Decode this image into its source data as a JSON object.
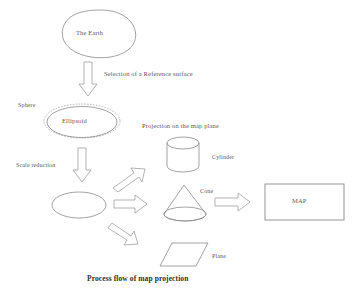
{
  "figure": {
    "caption": "Process flow of map projection",
    "background_color": "#ffffff",
    "stroke_color": "#8a8a8a",
    "text_color": "#5a5a5a"
  },
  "nodes": {
    "earth": {
      "label": "The Earth",
      "shape": "irregular-blob"
    },
    "sphere": {
      "label": "Sphere",
      "shape": "dashed-ellipse"
    },
    "ellipsoid": {
      "label": "Ellipsoid",
      "shape": "ellipse"
    },
    "reduced_ellipse": {
      "label": "",
      "shape": "ellipse"
    },
    "cylinder": {
      "label": "Cylinder",
      "shape": "cylinder"
    },
    "cone": {
      "label": "Cone",
      "shape": "cone"
    },
    "plane": {
      "label": "Plane",
      "shape": "parallelogram"
    },
    "map": {
      "label": "MAP",
      "shape": "rectangle"
    }
  },
  "edges": {
    "earth_to_ellipsoid": {
      "label": "Selection of a Reference surface",
      "direction": "down"
    },
    "ellipsoid_to_reduced": {
      "label": "Scale reduction",
      "direction": "down"
    },
    "projection_group": {
      "label": "Projection on the map plane"
    },
    "to_cylinder": {
      "label": "",
      "direction": "up-right"
    },
    "to_cone": {
      "label": "",
      "direction": "right"
    },
    "to_plane": {
      "label": "",
      "direction": "down-right"
    },
    "cone_to_map": {
      "label": "",
      "direction": "right"
    }
  }
}
